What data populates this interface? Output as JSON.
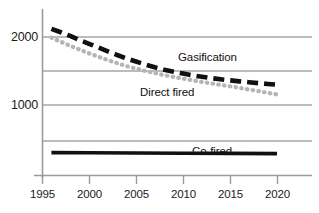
{
  "chart_data": {
    "type": "line",
    "title": "",
    "xlabel": "",
    "ylabel": "",
    "xlim": [
      1995,
      2020
    ],
    "ylim": [
      0,
      2250
    ],
    "grid": true,
    "gridlines_y": [
      2000,
      1500,
      1000,
      500
    ],
    "legend_position": "inline-annotations",
    "x_ticks": [
      "1995",
      "2000",
      "2005",
      "2010",
      "2015",
      "2020"
    ],
    "x_tick_values": [
      1995,
      2000,
      2005,
      2010,
      2015,
      2020
    ],
    "y_ticks": [
      "2000",
      "1000"
    ],
    "y_tick_values": [
      2000,
      1000
    ],
    "series": [
      {
        "name": "Gasification",
        "style": "dashed",
        "color": "#111111",
        "x": [
          1996,
          1997,
          1998,
          1999,
          2000,
          2001,
          2002,
          2003,
          2004,
          2005,
          2006,
          2007,
          2008,
          2009,
          2010,
          2011,
          2012,
          2013,
          2014,
          2015,
          2016,
          2017,
          2018,
          2019,
          2020
        ],
        "values": [
          2120,
          2070,
          2015,
          1955,
          1900,
          1845,
          1790,
          1735,
          1685,
          1640,
          1595,
          1555,
          1520,
          1490,
          1462,
          1437,
          1415,
          1395,
          1378,
          1362,
          1348,
          1335,
          1322,
          1310,
          1300
        ]
      },
      {
        "name": "Direct fired",
        "style": "dotted",
        "color": "#b5b5b5",
        "x": [
          1996,
          1997,
          1998,
          1999,
          2000,
          2001,
          2002,
          2003,
          2004,
          2005,
          2006,
          2007,
          2008,
          2009,
          2010,
          2011,
          2012,
          2013,
          2014,
          2015,
          2016,
          2017,
          2018,
          2019,
          2020
        ],
        "values": [
          1990,
          1930,
          1870,
          1815,
          1760,
          1710,
          1660,
          1615,
          1572,
          1535,
          1500,
          1468,
          1440,
          1412,
          1388,
          1363,
          1340,
          1318,
          1296,
          1275,
          1252,
          1228,
          1205,
          1180,
          1155
        ]
      },
      {
        "name": "Co-fired",
        "style": "solid",
        "color": "#111111",
        "x": [
          1996,
          2000,
          2005,
          2010,
          2015,
          2020
        ],
        "values": [
          300,
          297,
          294,
          291,
          288,
          285
        ]
      }
    ],
    "annotations": [
      {
        "text": "Gasification",
        "x": 2010,
        "y": 1640
      },
      {
        "text": "Direct fired",
        "x": 2001,
        "y": 1290
      },
      {
        "text": "Co-fired",
        "x": 2013,
        "y": 430
      }
    ]
  },
  "axes": {
    "y_labels": [
      {
        "text": "2000",
        "value": 2000
      },
      {
        "text": "1000",
        "value": 1000
      }
    ],
    "x_labels": [
      {
        "text": "1995",
        "value": 1995
      },
      {
        "text": "2000",
        "value": 2000
      },
      {
        "text": "2005",
        "value": 2005
      },
      {
        "text": "2010",
        "value": 2010
      },
      {
        "text": "2015",
        "value": 2015
      },
      {
        "text": "2020",
        "value": 2020
      }
    ]
  },
  "colors": {
    "background": "#ffffff",
    "grid": "#a6a6a6",
    "axis": "#9a9a9a",
    "gasification": "#111111",
    "direct_fired": "#b5b5b5",
    "cofired": "#111111",
    "text": "#1a1a1a"
  }
}
